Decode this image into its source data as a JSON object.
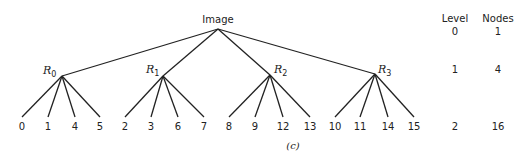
{
  "diagram": {
    "root": {
      "label": "Image",
      "x": 218,
      "y": 29
    },
    "regions": [
      {
        "label": "R",
        "sub": "0",
        "x": 62,
        "y": 76,
        "children": [
          "0",
          "1",
          "4",
          "5"
        ],
        "child_x": [
          22,
          48,
          75,
          100
        ]
      },
      {
        "label": "R",
        "sub": "1",
        "x": 163,
        "y": 76,
        "children": [
          "2",
          "3",
          "6",
          "7"
        ],
        "child_x": [
          125,
          151,
          178,
          204
        ]
      },
      {
        "label": "R",
        "sub": "2",
        "x": 270,
        "y": 75,
        "children": [
          "8",
          "9",
          "12",
          "13"
        ],
        "child_x": [
          229,
          255,
          283,
          310
        ]
      },
      {
        "label": "R",
        "sub": "3",
        "x": 375,
        "y": 74,
        "children": [
          "10",
          "11",
          "14",
          "15"
        ],
        "child_x": [
          335,
          360,
          388,
          414
        ]
      }
    ],
    "leaf_y": 117,
    "table": {
      "headers": [
        "Level",
        "Nodes"
      ],
      "rows": [
        {
          "level": "0",
          "nodes": "1"
        },
        {
          "level": "1",
          "nodes": "4"
        },
        {
          "level": "2",
          "nodes": "16"
        }
      ]
    },
    "caption": "(c)"
  }
}
